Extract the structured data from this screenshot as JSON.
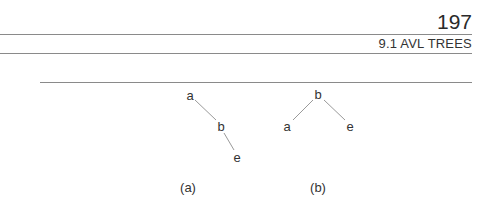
{
  "header": {
    "page_number": "197",
    "section_title": "9.1 AVL TREES"
  },
  "figure": {
    "tree_a": {
      "caption": "(a)",
      "nodes": [
        {
          "label": "a",
          "x": 190,
          "y": 95
        },
        {
          "label": "b",
          "x": 221,
          "y": 126
        },
        {
          "label": "e",
          "x": 237,
          "y": 157
        }
      ],
      "edges": [
        [
          "a",
          "b"
        ],
        [
          "b",
          "e"
        ]
      ]
    },
    "tree_b": {
      "caption": "(b)",
      "nodes": [
        {
          "label": "b",
          "x": 318,
          "y": 94
        },
        {
          "label": "a",
          "x": 287,
          "y": 126
        },
        {
          "label": "e",
          "x": 350,
          "y": 126
        }
      ],
      "edges": [
        [
          "b",
          "a"
        ],
        [
          "b",
          "e"
        ]
      ]
    }
  }
}
